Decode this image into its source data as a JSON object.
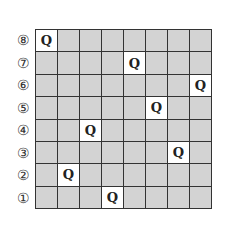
{
  "board": {
    "size": 8,
    "row_labels": [
      "⑧",
      "⑦",
      "⑥",
      "⑤",
      "④",
      "③",
      "②",
      "①"
    ],
    "queen_symbol": "Q",
    "queens": [
      {
        "row": "⑧",
        "col": 1
      },
      {
        "row": "⑦",
        "col": 5
      },
      {
        "row": "⑥",
        "col": 8
      },
      {
        "row": "⑤",
        "col": 6
      },
      {
        "row": "④",
        "col": 3
      },
      {
        "row": "③",
        "col": 7
      },
      {
        "row": "②",
        "col": 2
      },
      {
        "row": "①",
        "col": 4
      }
    ],
    "colors": {
      "empty_cell": "#d3d3d3",
      "queen_cell": "#ffffff",
      "grid_line": "#333333"
    }
  }
}
